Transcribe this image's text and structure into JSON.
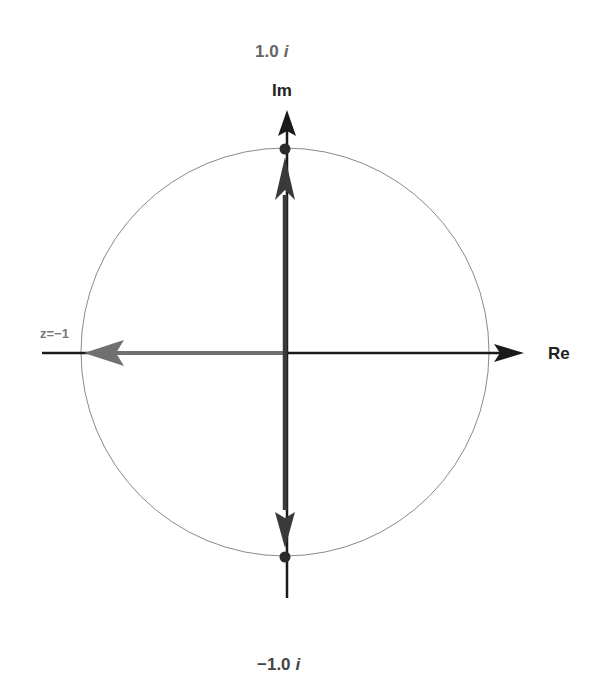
{
  "diagram": {
    "labels": {
      "top_value": "1.0 ī",
      "top_value_num": "1.0",
      "imag_unit": "i",
      "bottom_value_num": "−1.0",
      "imag_axis": "Im",
      "real_axis": "Re",
      "point_label": "z=−1"
    },
    "circle": {
      "cx": 285,
      "cy": 352,
      "r": 204,
      "stroke": "#8a8a8a"
    },
    "colors": {
      "axis": "#1a1a1a",
      "vector_vertical": "#3a3a3a",
      "vector_horizontal": "#707070",
      "label_gray": "#666666",
      "label_dark": "#222222"
    },
    "points": [
      {
        "name": "i",
        "x": 285,
        "y": 148
      },
      {
        "name": "-i",
        "x": 285,
        "y": 557
      }
    ]
  }
}
